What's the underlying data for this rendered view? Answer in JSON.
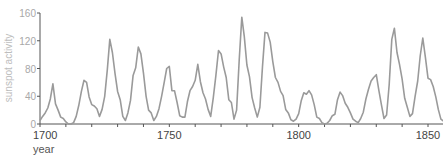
{
  "chart_data": {
    "type": "line",
    "title": "",
    "xlabel": "year",
    "ylabel": "sunspot activity",
    "xlim": [
      1700,
      1856
    ],
    "ylim": [
      0,
      160
    ],
    "x_ticks": [
      1700,
      1750,
      1800,
      1850
    ],
    "x_minor_tick_step": 10,
    "y_ticks": [
      0,
      40,
      80,
      120,
      160
    ],
    "grid": false,
    "legend": null,
    "line_color": "#9a9a9a",
    "series": [
      {
        "name": "sunspot activity",
        "x": [
          1700,
          1701,
          1702,
          1703,
          1704,
          1705,
          1706,
          1707,
          1708,
          1709,
          1710,
          1711,
          1712,
          1713,
          1714,
          1715,
          1716,
          1717,
          1718,
          1719,
          1720,
          1721,
          1722,
          1723,
          1724,
          1725,
          1726,
          1727,
          1728,
          1729,
          1730,
          1731,
          1732,
          1733,
          1734,
          1735,
          1736,
          1737,
          1738,
          1739,
          1740,
          1741,
          1742,
          1743,
          1744,
          1745,
          1746,
          1747,
          1748,
          1749,
          1750,
          1751,
          1752,
          1753,
          1754,
          1755,
          1756,
          1757,
          1758,
          1759,
          1760,
          1761,
          1762,
          1763,
          1764,
          1765,
          1766,
          1767,
          1768,
          1769,
          1770,
          1771,
          1772,
          1773,
          1774,
          1775,
          1776,
          1777,
          1778,
          1779,
          1780,
          1781,
          1782,
          1783,
          1784,
          1785,
          1786,
          1787,
          1788,
          1789,
          1790,
          1791,
          1792,
          1793,
          1794,
          1795,
          1796,
          1797,
          1798,
          1799,
          1800,
          1801,
          1802,
          1803,
          1804,
          1805,
          1806,
          1807,
          1808,
          1809,
          1810,
          1811,
          1812,
          1813,
          1814,
          1815,
          1816,
          1817,
          1818,
          1819,
          1820,
          1821,
          1822,
          1823,
          1824,
          1825,
          1826,
          1827,
          1828,
          1829,
          1830,
          1831,
          1832,
          1833,
          1834,
          1835,
          1836,
          1837,
          1838,
          1839,
          1840,
          1841,
          1842,
          1843,
          1844,
          1845,
          1846,
          1847,
          1848,
          1849,
          1850,
          1851,
          1852,
          1853,
          1854,
          1855,
          1856
        ],
        "values": [
          5,
          11,
          16,
          23,
          36,
          58,
          29,
          20,
          10,
          8,
          3,
          0,
          0,
          2,
          11,
          27,
          47,
          63,
          60,
          39,
          28,
          26,
          22,
          11,
          21,
          40,
          78,
          122,
          103,
          73,
          47,
          35,
          11,
          5,
          16,
          34,
          70,
          81,
          111,
          101,
          73,
          40,
          20,
          16,
          5,
          11,
          22,
          40,
          60,
          80,
          83,
          48,
          48,
          31,
          12,
          10,
          10,
          32,
          48,
          54,
          63,
          86,
          61,
          45,
          36,
          21,
          11,
          38,
          70,
          106,
          101,
          82,
          67,
          35,
          31,
          7,
          20,
          92,
          154,
          126,
          85,
          68,
          38,
          23,
          10,
          24,
          83,
          132,
          131,
          118,
          90,
          67,
          60,
          47,
          41,
          21,
          16,
          6,
          4,
          7,
          15,
          34,
          45,
          43,
          48,
          42,
          28,
          10,
          8,
          2,
          0,
          1,
          5,
          12,
          14,
          35,
          46,
          41,
          30,
          24,
          16,
          7,
          4,
          2,
          8,
          17,
          36,
          50,
          62,
          67,
          71,
          48,
          28,
          8,
          13,
          57,
          122,
          138,
          103,
          86,
          65,
          37,
          24,
          11,
          15,
          40,
          62,
          98,
          124,
          96,
          66,
          64,
          54,
          39,
          21,
          7,
          4
        ]
      }
    ]
  }
}
